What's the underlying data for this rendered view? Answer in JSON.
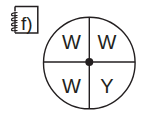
{
  "figure": {
    "label": "f)",
    "label_icon": "notebook-icon",
    "colors": {
      "stroke": "#231f20",
      "background": "#ffffff"
    }
  },
  "spinner": {
    "shape": "circle",
    "sections": 4,
    "quadrants": [
      {
        "position": "top-left",
        "label": "W"
      },
      {
        "position": "top-right",
        "label": "W"
      },
      {
        "position": "bottom-left",
        "label": "W"
      },
      {
        "position": "bottom-right",
        "label": "Y"
      }
    ],
    "center_marker": "pivot-dot"
  }
}
